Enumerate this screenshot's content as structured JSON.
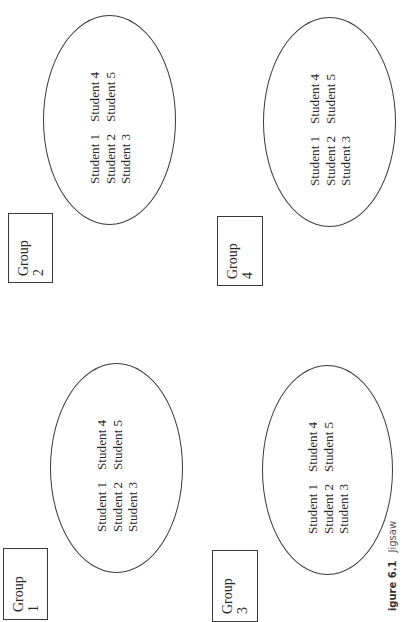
{
  "figure": {
    "caption_label": "igure 6.1",
    "caption_title": "Jigsaw"
  },
  "groups": [
    {
      "id": "group-1",
      "label_word": "Group",
      "label_num": "1",
      "students": {
        "row1": [
          "Student 1",
          "Student 4"
        ],
        "row2": [
          "Student 2",
          "Student 5"
        ],
        "row3": [
          "Student 3"
        ]
      }
    },
    {
      "id": "group-2",
      "label_word": "Group",
      "label_num": "2",
      "students": {
        "row1": [
          "Student 1",
          "Student 4"
        ],
        "row2": [
          "Student 2",
          "Student 5"
        ],
        "row3": [
          "Student 3"
        ]
      }
    },
    {
      "id": "group-3",
      "label_word": "Group",
      "label_num": "3",
      "students": {
        "row1": [
          "Student 1",
          "Student 4"
        ],
        "row2": [
          "Student 2",
          "Student 5"
        ],
        "row3": [
          "Student 3"
        ]
      }
    },
    {
      "id": "group-4",
      "label_word": "Group",
      "label_num": "4",
      "students": {
        "row1": [
          "Student 1",
          "Student 4"
        ],
        "row2": [
          "Student 2",
          "Student 5"
        ],
        "row3": [
          "Student 3"
        ]
      }
    }
  ]
}
